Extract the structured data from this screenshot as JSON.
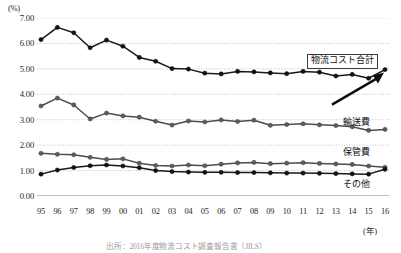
{
  "chart_data": {
    "type": "line",
    "title": "",
    "xlabel": "(年)",
    "ylabel": "(%)",
    "ylim": [
      0.0,
      7.0
    ],
    "ytick_step": 1.0,
    "grid": true,
    "legend_position": "inline-right",
    "categories": [
      "95",
      "96",
      "97",
      "98",
      "99",
      "00",
      "01",
      "02",
      "03",
      "04",
      "05",
      "06",
      "07",
      "08",
      "09",
      "10",
      "11",
      "12",
      "13",
      "14",
      "15",
      "16"
    ],
    "yticks": [
      "0.00",
      "1.00",
      "2.00",
      "3.00",
      "4.00",
      "5.00",
      "6.00",
      "7.00"
    ],
    "series": [
      {
        "name": "物流コスト合計",
        "color": "#1a1a1a",
        "marker": "circle-dark",
        "values": [
          6.15,
          6.63,
          6.42,
          5.83,
          6.13,
          5.89,
          5.45,
          5.3,
          5.01,
          4.99,
          4.83,
          4.8,
          4.9,
          4.88,
          4.84,
          4.81,
          4.9,
          4.87,
          4.72,
          4.78,
          4.63,
          4.97
        ]
      },
      {
        "name": "輸送費",
        "color": "#4d4d4d",
        "marker": "circle-gray",
        "values": [
          3.54,
          3.85,
          3.58,
          3.03,
          3.26,
          3.15,
          3.1,
          2.94,
          2.79,
          2.95,
          2.91,
          2.99,
          2.93,
          2.98,
          2.78,
          2.81,
          2.84,
          2.8,
          2.77,
          2.72,
          2.58,
          2.62
        ]
      },
      {
        "name": "保管費",
        "color": "#4d4d4d",
        "marker": "circle-gray",
        "values": [
          1.68,
          1.64,
          1.62,
          1.52,
          1.44,
          1.46,
          1.29,
          1.2,
          1.18,
          1.22,
          1.19,
          1.25,
          1.3,
          1.32,
          1.27,
          1.29,
          1.31,
          1.28,
          1.26,
          1.24,
          1.18,
          1.13
        ]
      },
      {
        "name": "その他",
        "color": "#1a1a1a",
        "marker": "circle-dark",
        "values": [
          0.86,
          1.02,
          1.12,
          1.19,
          1.22,
          1.18,
          1.11,
          1.0,
          0.96,
          0.94,
          0.93,
          0.93,
          0.92,
          0.92,
          0.91,
          0.9,
          0.9,
          0.89,
          0.88,
          0.87,
          0.86,
          1.05
        ]
      }
    ],
    "annotations": [
      {
        "name": "arrow-to-total-2016",
        "type": "arrow",
        "target": "物流コスト合計 2016"
      }
    ]
  },
  "labels": {
    "unit_y": "(%)",
    "unit_x": "(年)",
    "total": "物流コスト合計",
    "transport": "輸送費",
    "storage": "保管費",
    "other": "その他"
  },
  "source": {
    "text": "出所：2016年度物流コスト調査報告書（JILS）"
  }
}
